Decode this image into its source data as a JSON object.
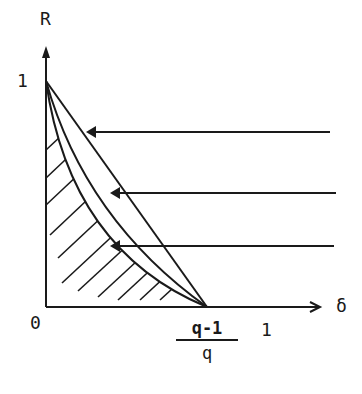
{
  "diagram": {
    "labels": {
      "y_axis": "R",
      "x_axis": "δ",
      "origin": "0",
      "y_tick_one": "1",
      "x_tick_one": "1",
      "x_tick_frac_numerator": "q-1",
      "x_tick_frac_denominator": "q"
    },
    "curves": [
      {
        "name": "straight-line",
        "description": "Straight line from (0,1) to ((q-1)/q, 0)"
      },
      {
        "name": "middle-curve",
        "description": "Slightly convex curve from (0,1) to ((q-1)/q, 0)"
      },
      {
        "name": "lower-curve",
        "description": "More convex curve from (0,1) to ((q-1)/q, 0); region below hatched"
      }
    ],
    "arrows": [
      {
        "name": "arrow-to-straight-line",
        "points_to": "straight-line"
      },
      {
        "name": "arrow-to-middle-curve",
        "points_to": "middle-curve"
      },
      {
        "name": "arrow-to-lower-curve",
        "points_to": "lower-curve"
      }
    ],
    "shaded_region": "hatched area under lower curve",
    "colors": {
      "ink": "#1a1a1a",
      "background": "#ffffff"
    }
  }
}
